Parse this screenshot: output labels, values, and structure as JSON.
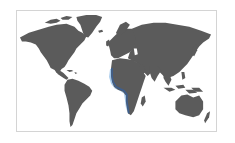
{
  "map": {
    "type": "world-map",
    "projection": "equirectangular",
    "colors": {
      "land": "#5b5b5b",
      "ocean": "#ffffff",
      "frame_border": "#d4d4d4",
      "highlight_fill": "#9ec5ea",
      "highlight_edge": "#3d5f8f"
    },
    "highlighted_region": {
      "label": "West African coast",
      "description": "Coastal band from Western Sahara/Senegal around the Gulf of Guinea down to Angola/Namibia"
    },
    "continents": [
      "North America",
      "Greenland",
      "South America",
      "Europe",
      "Africa",
      "Asia",
      "Australia",
      "New Zealand"
    ]
  }
}
